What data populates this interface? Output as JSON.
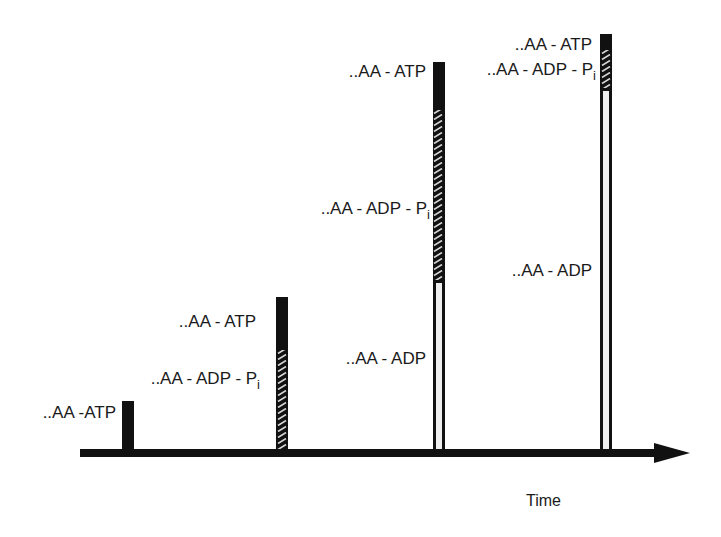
{
  "diagram": {
    "axis": {
      "label": "Time",
      "x_start": 80,
      "x_end": 690,
      "y": 453
    },
    "colors": {
      "stroke": "#111111",
      "adp_fill": "#eeeeee",
      "background": "#ffffff"
    },
    "bars": [
      {
        "id": "bar1",
        "x": 122,
        "width": 12,
        "top": 401,
        "segments": [
          {
            "state": "ATP",
            "from": 401,
            "to": 453,
            "fill": "solid"
          }
        ],
        "labels": [
          {
            "text": "..AA -ATP",
            "sub": "",
            "right": 116,
            "top": 404
          }
        ]
      },
      {
        "id": "bar2",
        "x": 276,
        "width": 12,
        "top": 297,
        "segments": [
          {
            "state": "ATP",
            "from": 297,
            "to": 350,
            "fill": "solid"
          },
          {
            "state": "ADP-Pi",
            "from": 350,
            "to": 453,
            "fill": "hatched"
          }
        ],
        "labels": [
          {
            "text": "..AA - ATP",
            "sub": "",
            "right": 256,
            "top": 313
          },
          {
            "text": "..AA - ADP - P",
            "sub": "i",
            "right": 260,
            "top": 370
          }
        ]
      },
      {
        "id": "bar3",
        "x": 433,
        "width": 12,
        "top": 62,
        "segments": [
          {
            "state": "ATP",
            "from": 62,
            "to": 110,
            "fill": "solid"
          },
          {
            "state": "ADP-Pi",
            "from": 110,
            "to": 280,
            "fill": "hatched"
          },
          {
            "state": "ADP",
            "from": 280,
            "to": 453,
            "fill": "open"
          }
        ],
        "labels": [
          {
            "text": "..AA - ATP",
            "sub": "",
            "right": 426,
            "top": 63
          },
          {
            "text": "..AA - ADP - P",
            "sub": "i",
            "right": 430,
            "top": 200
          },
          {
            "text": "..AA - ADP",
            "sub": "",
            "right": 426,
            "top": 350
          }
        ]
      },
      {
        "id": "bar4",
        "x": 600,
        "width": 12,
        "top": 34,
        "segments": [
          {
            "state": "ATP",
            "from": 34,
            "to": 50,
            "fill": "solid"
          },
          {
            "state": "ADP-Pi",
            "from": 50,
            "to": 88,
            "fill": "hatched"
          },
          {
            "state": "ADP",
            "from": 88,
            "to": 453,
            "fill": "open"
          }
        ],
        "labels": [
          {
            "text": "..AA - ATP",
            "sub": "",
            "right": 592,
            "top": 36
          },
          {
            "text": "..AA - ADP - P",
            "sub": "i",
            "right": 596,
            "top": 61
          },
          {
            "text": "..AA - ADP",
            "sub": "",
            "right": 592,
            "top": 262
          }
        ]
      }
    ]
  }
}
